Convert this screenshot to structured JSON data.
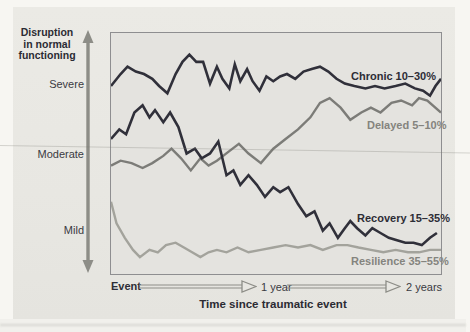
{
  "figure": {
    "y_axis": {
      "title_line1": "Disruption",
      "title_line2": "in normal",
      "title_line3": "functioning",
      "ticks": [
        "Severe",
        "Moderate",
        "Mild"
      ]
    },
    "x_axis": {
      "origin_label": "Event",
      "tick_1": "1 year",
      "tick_2": "2 years",
      "title": "Time since traumatic event"
    },
    "colors": {
      "dark_line": "#30303a",
      "gray_line": "#7c7c78",
      "light_gray_line": "#a3a39c",
      "arrow_gray": "#8d8d87",
      "page_bg": "#e8e7e2",
      "plot_bg": "#e4e3df"
    }
  },
  "chart_data": {
    "type": "line",
    "title": "",
    "xlabel": "Time since traumatic event",
    "ylabel": "Disruption in normal functioning",
    "x_unit": "months since event",
    "x_range": [
      0,
      24
    ],
    "y_unit": "disruption level (qualitative, 0-100; Mild=20, Moderate=50, Severe=80)",
    "y_range": [
      0,
      100
    ],
    "grid": false,
    "legend_position": "labels at right end of each line",
    "series": [
      {
        "name": "delayed",
        "label": "Delayed 5–10%",
        "color": "#7c7c78",
        "stroke_width": 2.4,
        "points": [
          [
            0,
            45
          ],
          [
            0.7,
            47
          ],
          [
            1.5,
            46
          ],
          [
            2.3,
            44
          ],
          [
            3.0,
            46
          ],
          [
            3.8,
            49
          ],
          [
            4.4,
            52
          ],
          [
            5.1,
            48
          ],
          [
            5.8,
            43
          ],
          [
            6.5,
            48
          ],
          [
            7.1,
            45
          ],
          [
            7.7,
            47
          ],
          [
            8.6,
            51
          ],
          [
            9.3,
            54
          ],
          [
            10.0,
            50
          ],
          [
            10.9,
            46
          ],
          [
            11.8,
            52
          ],
          [
            12.7,
            56
          ],
          [
            13.6,
            60
          ],
          [
            14.5,
            65
          ],
          [
            15.2,
            71
          ],
          [
            15.9,
            73
          ],
          [
            16.7,
            69
          ],
          [
            17.4,
            64
          ],
          [
            18.2,
            67
          ],
          [
            18.9,
            69
          ],
          [
            19.6,
            67
          ],
          [
            20.4,
            71
          ],
          [
            21.1,
            72
          ],
          [
            21.9,
            70
          ],
          [
            22.4,
            73
          ],
          [
            23.0,
            72
          ],
          [
            24.0,
            67
          ]
        ]
      },
      {
        "name": "resilience",
        "label": "Resilience 35–55%",
        "color": "#a3a39c",
        "stroke_width": 2.4,
        "points": [
          [
            0,
            30
          ],
          [
            0.4,
            21
          ],
          [
            1.0,
            15
          ],
          [
            1.6,
            10
          ],
          [
            2.1,
            7
          ],
          [
            2.8,
            10
          ],
          [
            3.4,
            9
          ],
          [
            4.0,
            12
          ],
          [
            4.7,
            13
          ],
          [
            5.3,
            11
          ],
          [
            5.9,
            9
          ],
          [
            6.5,
            7
          ],
          [
            7.1,
            9
          ],
          [
            7.7,
            10
          ],
          [
            8.4,
            9
          ],
          [
            9.2,
            11
          ],
          [
            10.0,
            9
          ],
          [
            10.9,
            10
          ],
          [
            11.8,
            11
          ],
          [
            12.7,
            12
          ],
          [
            13.6,
            11
          ],
          [
            14.5,
            12
          ],
          [
            15.4,
            10
          ],
          [
            16.4,
            12
          ],
          [
            17.2,
            12
          ],
          [
            18.0,
            11
          ],
          [
            18.9,
            10
          ],
          [
            19.8,
            9
          ],
          [
            20.7,
            10
          ],
          [
            21.6,
            9
          ],
          [
            22.4,
            9
          ],
          [
            23.2,
            10
          ],
          [
            24.0,
            10
          ]
        ]
      },
      {
        "name": "recovery",
        "label": "Recovery 15–35%",
        "color": "#30303a",
        "stroke_width": 2.6,
        "points": [
          [
            0,
            56
          ],
          [
            0.6,
            60
          ],
          [
            1.1,
            58
          ],
          [
            1.7,
            67
          ],
          [
            2.3,
            70
          ],
          [
            2.8,
            65
          ],
          [
            3.2,
            68
          ],
          [
            3.8,
            63
          ],
          [
            4.3,
            67
          ],
          [
            4.9,
            61
          ],
          [
            5.5,
            50
          ],
          [
            6.1,
            52
          ],
          [
            6.6,
            48
          ],
          [
            7.2,
            50
          ],
          [
            7.8,
            55
          ],
          [
            8.4,
            41
          ],
          [
            8.9,
            43
          ],
          [
            9.4,
            37
          ],
          [
            10.0,
            41
          ],
          [
            10.6,
            37
          ],
          [
            11.2,
            32
          ],
          [
            11.8,
            36
          ],
          [
            12.3,
            34
          ],
          [
            12.9,
            36
          ],
          [
            13.6,
            29
          ],
          [
            14.2,
            24
          ],
          [
            14.8,
            26
          ],
          [
            15.4,
            18
          ],
          [
            15.9,
            21
          ],
          [
            16.5,
            15
          ],
          [
            17.0,
            19
          ],
          [
            17.4,
            22
          ],
          [
            17.9,
            19
          ],
          [
            18.5,
            16
          ],
          [
            19.0,
            19
          ],
          [
            19.6,
            17
          ],
          [
            20.2,
            15
          ],
          [
            20.8,
            14
          ],
          [
            21.4,
            13
          ],
          [
            22.0,
            13
          ],
          [
            22.6,
            12
          ],
          [
            23.2,
            15
          ],
          [
            23.7,
            17
          ]
        ]
      },
      {
        "name": "chronic",
        "label": "Chronic 10–30%",
        "color": "#30303a",
        "stroke_width": 2.6,
        "points": [
          [
            0,
            78
          ],
          [
            0.7,
            83
          ],
          [
            1.2,
            86
          ],
          [
            1.8,
            84
          ],
          [
            2.4,
            83
          ],
          [
            3.0,
            81
          ],
          [
            3.5,
            78
          ],
          [
            4.1,
            75
          ],
          [
            4.7,
            83
          ],
          [
            5.2,
            88
          ],
          [
            5.7,
            91
          ],
          [
            6.2,
            88
          ],
          [
            6.7,
            88
          ],
          [
            7.2,
            79
          ],
          [
            7.7,
            86
          ],
          [
            8.1,
            81
          ],
          [
            8.6,
            77
          ],
          [
            9.0,
            87
          ],
          [
            9.4,
            80
          ],
          [
            9.9,
            85
          ],
          [
            10.3,
            80
          ],
          [
            10.8,
            76
          ],
          [
            11.3,
            82
          ],
          [
            11.8,
            80
          ],
          [
            12.3,
            82
          ],
          [
            12.8,
            83
          ],
          [
            13.4,
            81
          ],
          [
            14.0,
            84
          ],
          [
            14.6,
            85
          ],
          [
            15.2,
            86
          ],
          [
            15.8,
            84
          ],
          [
            16.4,
            81
          ],
          [
            17.0,
            79
          ],
          [
            17.7,
            78
          ],
          [
            18.5,
            77
          ],
          [
            19.2,
            78
          ],
          [
            19.9,
            77
          ],
          [
            20.7,
            78
          ],
          [
            21.4,
            79
          ],
          [
            22.1,
            77
          ],
          [
            22.7,
            76
          ],
          [
            23.2,
            74
          ],
          [
            23.6,
            78
          ],
          [
            24.0,
            81
          ]
        ]
      }
    ]
  }
}
